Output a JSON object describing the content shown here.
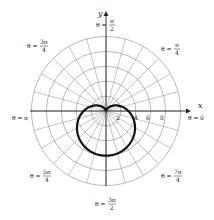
{
  "chart_data": {
    "type": "polar",
    "title": "",
    "equation": "r = 3(1 - sin θ)",
    "series": [
      {
        "name": "cardioid",
        "a": 3,
        "form": "a*(1 - sin(theta))",
        "color": "#111111"
      }
    ],
    "radial_ticks": [
      2,
      4,
      6,
      8
    ],
    "radial_max": 10,
    "radial_tick_labels": [
      "2",
      "4",
      "6",
      "8"
    ],
    "angle_step_deg": 15,
    "axis_labels": {
      "x": "x",
      "y": "y"
    },
    "angle_labels": [
      {
        "angle_deg": 0,
        "text": "θ = 0"
      },
      {
        "angle_deg": 45,
        "text": "θ = π/4"
      },
      {
        "angle_deg": 90,
        "text": "θ = π/2"
      },
      {
        "angle_deg": 135,
        "text": "θ = 3π/4"
      },
      {
        "angle_deg": 180,
        "text": "θ = π"
      },
      {
        "angle_deg": 225,
        "text": "θ = 5π/4"
      },
      {
        "angle_deg": 270,
        "text": "θ = 3π/2"
      },
      {
        "angle_deg": 315,
        "text": "θ = 7π/4"
      }
    ],
    "grid": true
  },
  "labels": {
    "x_axis": "x",
    "y_axis": "y",
    "theta_prefix": "θ =",
    "t0": "0",
    "tpi": "π",
    "t_pi_2_num": "π",
    "t_pi_2_den": "2",
    "t_pi_4_num": "π",
    "t_pi_4_den": "4",
    "t_3pi_4_num": "3π",
    "t_3pi_4_den": "4",
    "t_5pi_4_num": "5π",
    "t_5pi_4_den": "4",
    "t_7pi_4_num": "7π",
    "t_7pi_4_den": "4",
    "t_3pi_2_num": "3π",
    "t_3pi_2_den": "2",
    "tick_2": "2",
    "tick_4": "4",
    "tick_6": "6",
    "tick_8": "8"
  }
}
